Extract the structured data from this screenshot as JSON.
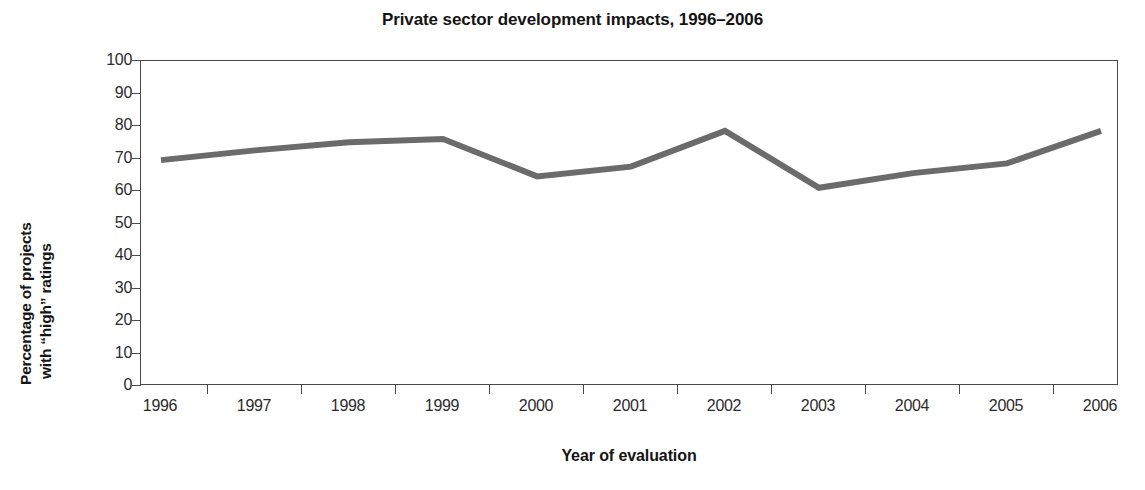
{
  "chart_data": {
    "type": "line",
    "title": "Private sector development impacts, 1996–2006",
    "xlabel": "Year of evaluation",
    "ylabel": "Percentage of projects with “high” ratings",
    "ylabel_lines": [
      "Percentage of projects",
      "with “high” ratings"
    ],
    "categories": [
      "1996",
      "1997",
      "1998",
      "1999",
      "2000",
      "2001",
      "2002",
      "2003",
      "2004",
      "2005",
      "2006"
    ],
    "x": [
      1996,
      1997,
      1998,
      1999,
      2000,
      2001,
      2002,
      2003,
      2004,
      2005,
      2006
    ],
    "values": [
      69.5,
      72.5,
      75,
      76,
      64.5,
      67.5,
      78.5,
      61,
      65.5,
      68.5,
      78.5
    ],
    "series": [
      {
        "name": "Percentage of projects with “high” ratings",
        "values": [
          69.5,
          72.5,
          75,
          76,
          64.5,
          67.5,
          78.5,
          61,
          65.5,
          68.5,
          78.5
        ]
      }
    ],
    "ylim": [
      0,
      100
    ],
    "yticks": [
      0,
      10,
      20,
      30,
      40,
      50,
      60,
      70,
      80,
      90,
      100
    ],
    "ytick_labels": [
      "0",
      "10",
      "20",
      "30",
      "40",
      "50",
      "60",
      "70",
      "80",
      "90",
      "100"
    ],
    "grid": false,
    "legend": false,
    "legend_position": "none",
    "line_color": "#6b6b6b",
    "line_width": 6,
    "axis_color": "#4a4a4a",
    "background_color": "#ffffff",
    "text_color": "#141414"
  }
}
